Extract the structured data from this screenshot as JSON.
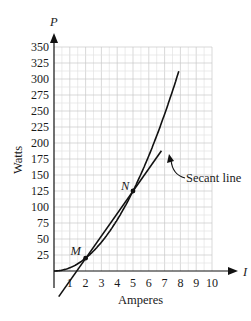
{
  "chart_data": {
    "type": "line",
    "title": "",
    "xlabel": "Amperes",
    "ylabel": "Watts",
    "x_axis_var": "I",
    "y_axis_var": "P",
    "xlim": [
      0,
      10
    ],
    "ylim": [
      0,
      350
    ],
    "x_ticks": [
      1,
      2,
      3,
      4,
      5,
      6,
      7,
      8,
      9,
      10
    ],
    "y_ticks": [
      25,
      50,
      75,
      100,
      125,
      150,
      175,
      200,
      225,
      250,
      275,
      300,
      325,
      350
    ],
    "grid": true,
    "series": [
      {
        "name": "Power curve",
        "formula": "P = 5I^2",
        "x": [
          0,
          1,
          2,
          3,
          4,
          5,
          6,
          7,
          7.9
        ],
        "values": [
          0,
          5,
          20,
          45,
          80,
          125,
          180,
          245,
          312
        ]
      },
      {
        "name": "Secant line",
        "x": [
          0.3,
          6.8
        ],
        "values": [
          -40,
          188
        ]
      }
    ],
    "points": [
      {
        "label": "M",
        "x": 2,
        "y": 20
      },
      {
        "label": "N",
        "x": 5,
        "y": 125
      }
    ],
    "annotations": [
      {
        "text": "Secant line",
        "points_to": "secant line near I=6.2"
      }
    ]
  },
  "labels": {
    "x_axis_var": "I",
    "y_axis_var": "P",
    "xlabel": "Amperes",
    "ylabel": "Watts",
    "secant_label": "Secant line",
    "point_m": "M",
    "point_n": "N"
  }
}
